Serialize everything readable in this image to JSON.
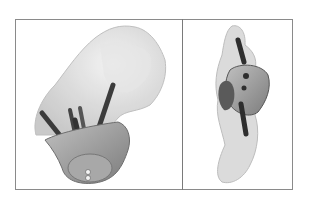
{
  "figure": {
    "panels": [
      {
        "id": "left",
        "view": "oblique-view",
        "subject": "translucent bone model with glenoid implant and four pegs"
      },
      {
        "id": "right",
        "view": "lateral-view",
        "subject": "translucent bone model with implant and pegs"
      }
    ],
    "colors": {
      "border": "#8a8a8a",
      "bone": "#d2d2d2",
      "implant": "#9a9a9a",
      "peg": "#3a3a3a"
    }
  }
}
